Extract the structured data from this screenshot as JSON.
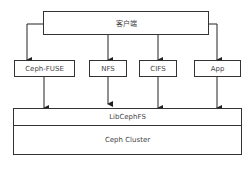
{
  "diagram": {
    "client": {
      "label": "客户端"
    },
    "interfaces": [
      {
        "label": "Ceph-FUSE"
      },
      {
        "label": "NFS"
      },
      {
        "label": "CIFS"
      },
      {
        "label": "App"
      }
    ],
    "library": {
      "label": "LibCephFS"
    },
    "cluster": {
      "label": "Ceph Cluster"
    },
    "line_color": "#222222"
  }
}
